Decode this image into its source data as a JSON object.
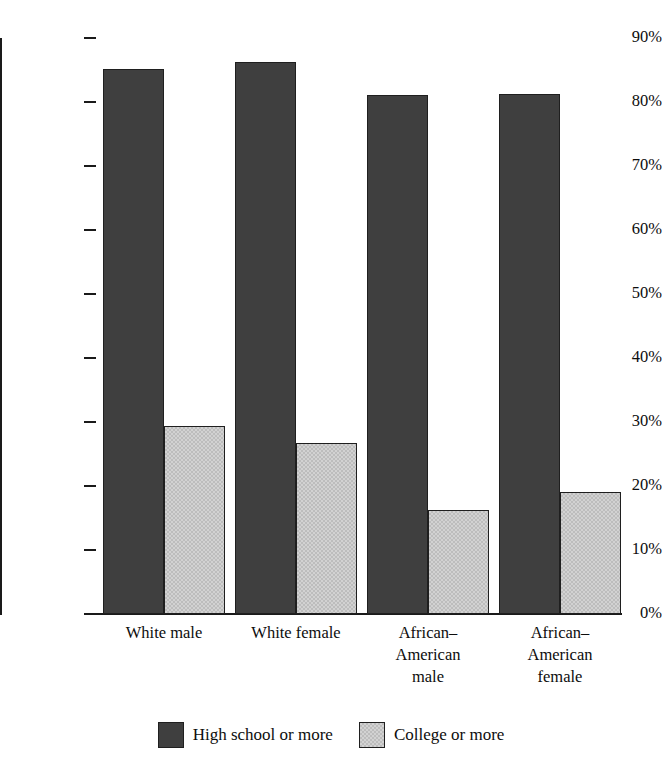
{
  "chart_data": {
    "type": "bar",
    "title": "",
    "xlabel": "",
    "ylabel": "Percent",
    "ylim": [
      0,
      90
    ],
    "ytick_labels": [
      "0%",
      "10%",
      "20%",
      "30%",
      "40%",
      "50%",
      "60%",
      "70%",
      "80%",
      "90%"
    ],
    "ytick_values": [
      0,
      10,
      20,
      30,
      40,
      50,
      60,
      70,
      80,
      90
    ],
    "grid": false,
    "legend_position": "bottom-center",
    "categories": [
      "White male",
      "White female",
      "African–American male",
      "African–American female"
    ],
    "category_label_lines": [
      [
        "White male"
      ],
      [
        "White female"
      ],
      [
        "African–",
        "American",
        "male"
      ],
      [
        "African–",
        "American",
        "female"
      ]
    ],
    "series": [
      {
        "name": "High school or more",
        "color": "#3f3f3f",
        "values": [
          85.1,
          86.3,
          81.1,
          81.2
        ]
      },
      {
        "name": "College or more",
        "color": "#d2d2d2",
        "values": [
          29.3,
          26.7,
          16.2,
          19.0
        ]
      }
    ]
  },
  "axis": {
    "ylabel": "Percent"
  },
  "legend": {
    "items": [
      {
        "label": "High school or more",
        "swatch": "dark"
      },
      {
        "label": "College or more",
        "swatch": "light"
      }
    ]
  }
}
